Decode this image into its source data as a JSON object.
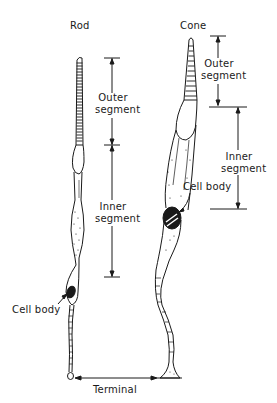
{
  "figure": {
    "cells": [
      {
        "id": "rod",
        "title": "Rod"
      },
      {
        "id": "cone",
        "title": "Cone"
      }
    ],
    "labels": {
      "rod_outer_segment_line1": "Outer",
      "rod_outer_segment_line2": "segment",
      "rod_inner_segment_line1": "Inner",
      "rod_inner_segment_line2": "segment",
      "rod_cell_body": "Cell body",
      "cone_outer_segment_line1": "Outer",
      "cone_outer_segment_line2": "segment",
      "cone_inner_segment_line1": "Inner",
      "cone_inner_segment_line2": "segment",
      "cone_cell_body": "Cell body",
      "terminal": "Terminal"
    },
    "colors": {
      "ink": "#1a1a1a",
      "background": "#ffffff"
    }
  }
}
